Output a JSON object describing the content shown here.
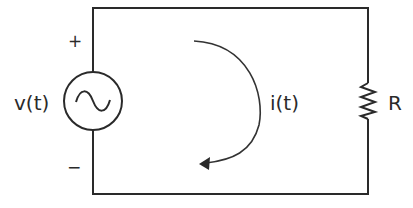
{
  "diagram": {
    "type": "circuit",
    "title": "",
    "components": {
      "source": {
        "kind": "ac-voltage-source",
        "label": "v(t)",
        "positive_label": "+",
        "negative_label": "−",
        "symbol": "sine-wave"
      },
      "resistor": {
        "kind": "resistor",
        "label": "R"
      },
      "current": {
        "kind": "current-arrow",
        "label": "i(t)",
        "direction": "clockwise"
      }
    },
    "colors": {
      "line": "#2a2a2a",
      "text": "#2a2a2a",
      "background": "#ffffff"
    }
  }
}
